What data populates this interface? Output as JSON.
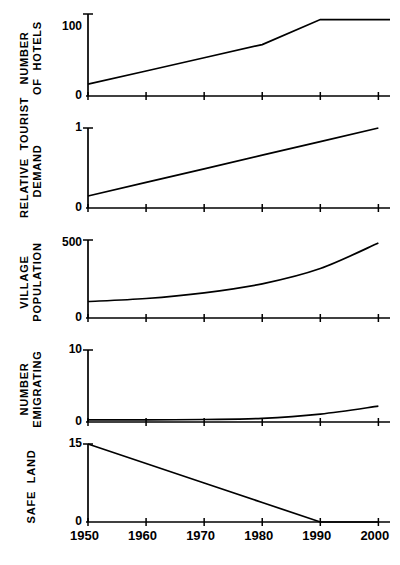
{
  "chart_data": {
    "type": "line",
    "title": "",
    "subtitle": "",
    "xlabel": "",
    "layout": {
      "panels": 5,
      "shared_x_axis": true,
      "grid": false,
      "legend": false,
      "x_tick_labels_on": "bottom-panel-only",
      "y_label_rotation_deg": -90
    },
    "x": [
      1950,
      1960,
      1970,
      1980,
      1990,
      2000
    ],
    "xlim": [
      1950,
      2002
    ],
    "xtick_labels": [
      "1950",
      "1960",
      "1970",
      "1980",
      "1990",
      "2000"
    ],
    "panels": [
      {
        "id": "number-of-hotels",
        "ylabel": "NUMBER\nOF HOTELS",
        "ylabel_lines": [
          "NUMBER",
          "OF  HOTELS"
        ],
        "ylim": [
          0,
          118
        ],
        "ytick_values": [
          0,
          100
        ],
        "ytick_labels": [
          "0",
          "100"
        ],
        "series": [
          {
            "name": "Number of hotels",
            "x": [
              1950,
              1960,
              1970,
              1980,
              1990,
              2000,
              2002
            ],
            "values": [
              17,
              36,
              55,
              74,
              110,
              110,
              110
            ],
            "shape": "linear-rise-then-plateau",
            "plateau_from": 1990,
            "plateau_value": 110
          }
        ]
      },
      {
        "id": "relative-tourist-demand",
        "ylabel": "RELATIVE TOURIST\nDEMAND",
        "ylabel_lines": [
          "RELATIVE  TOURIST",
          "DEMAND"
        ],
        "ylim": [
          0,
          1
        ],
        "ytick_values": [
          0,
          1
        ],
        "ytick_labels": [
          "0",
          "1"
        ],
        "series": [
          {
            "name": "Relative tourist demand",
            "x": [
              1950,
              1960,
              1970,
              1980,
              1990,
              2000
            ],
            "values": [
              0.15,
              0.32,
              0.49,
              0.66,
              0.83,
              1.0
            ],
            "shape": "linear-rise"
          }
        ]
      },
      {
        "id": "village-population",
        "ylabel": "VILLAGE\nPOPULATION",
        "ylabel_lines": [
          "VILLAGE",
          "POPULATION"
        ],
        "ylim": [
          0,
          520
        ],
        "ytick_values": [
          0,
          500
        ],
        "ytick_labels": [
          "0",
          "500"
        ],
        "series": [
          {
            "name": "Village population",
            "x": [
              1950,
              1960,
              1970,
              1980,
              1990,
              2000
            ],
            "values": [
              110,
              130,
              168,
              228,
              330,
              500
            ],
            "shape": "exponential-growth"
          }
        ]
      },
      {
        "id": "number-emigrating",
        "ylabel": "NUMBER\nEMIGRATING",
        "ylabel_lines": [
          "NUMBER",
          "EMIGRATING"
        ],
        "ylim": [
          0,
          10
        ],
        "ytick_values": [
          0,
          10
        ],
        "ytick_labels": [
          "0",
          "10"
        ],
        "series": [
          {
            "name": "Number emigrating",
            "x": [
              1950,
              1960,
              1970,
              1980,
              1990,
              2000
            ],
            "values": [
              0.3,
              0.3,
              0.35,
              0.5,
              1.1,
              2.2
            ],
            "shape": "flat-then-exponential-rise"
          }
        ]
      },
      {
        "id": "safe-land",
        "ylabel": "SAFE LAND",
        "ylabel_lines": [
          "SAFE  LAND"
        ],
        "ylim": [
          0,
          15
        ],
        "ytick_values": [
          0,
          15
        ],
        "ytick_labels": [
          "0",
          "15"
        ],
        "series": [
          {
            "name": "Safe land",
            "x": [
              1950,
              1960,
              1970,
              1980,
              1990,
              2000
            ],
            "values": [
              15,
              11.25,
              7.5,
              3.75,
              0,
              0
            ],
            "shape": "linear-decline-to-zero",
            "zero_from": 1990
          }
        ]
      }
    ],
    "colors": {
      "line": "#000000",
      "axis": "#000000",
      "background": "#ffffff"
    }
  }
}
